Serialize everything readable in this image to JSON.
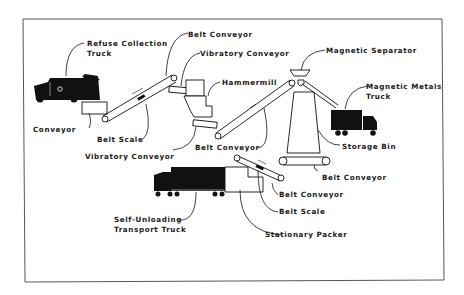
{
  "colors": {
    "ink": "#111111",
    "paper": "#ffffff",
    "frame": "#555555"
  },
  "labels": {
    "refuse_truck_1": "Refuse  Collection",
    "refuse_truck_2": "Truck",
    "conveyor": "Conveyor",
    "belt_scale_1": "Belt  Scale",
    "belt_conveyor_top": "Belt  Conveyor",
    "vibratory_conveyor_top": "Vibratory  Conveyor",
    "hammermill": "Hammermill",
    "vibratory_conveyor_bottom": "Vibratory  Conveyor",
    "belt_conveyor_mid": "Belt  Conveyor",
    "magnetic_separator": "Magnetic  Separator",
    "magnetic_metals_truck_1": "Magnetic  Metals",
    "magnetic_metals_truck_2": "Truck",
    "storage_bin": "Storage  Bin",
    "belt_conveyor_bin": "Belt  Conveyor",
    "belt_conveyor_packer": "Belt  Conveyor",
    "belt_scale_2": "Belt  Scale",
    "self_unloading_1": "Self-Unloading",
    "self_unloading_2": "Transport  Truck",
    "stationary_packer": "Stationary  Packer"
  }
}
